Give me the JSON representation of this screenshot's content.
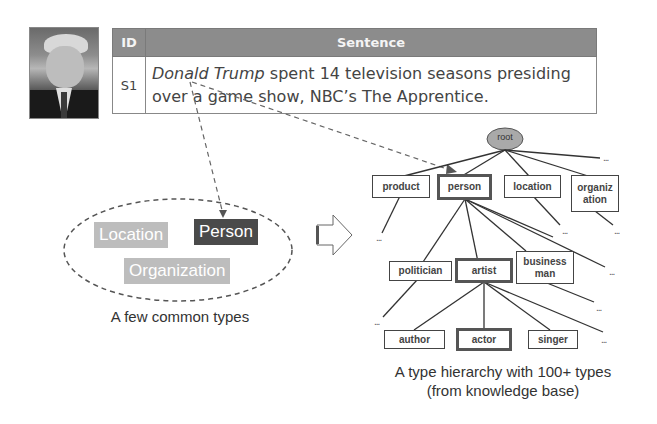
{
  "table": {
    "headers": [
      "ID",
      "Sentence"
    ],
    "rows": [
      {
        "id": "S1",
        "entity": "Donald Trump",
        "line1_rest": " spent 14 television seasons presiding",
        "line2": "over a game show, NBC’s The Apprentice."
      }
    ]
  },
  "left_panel": {
    "tags": [
      "Location",
      "Person",
      "Organization"
    ],
    "caption": "A few common types"
  },
  "hierarchy": {
    "root": "root",
    "level1": [
      "product",
      "person",
      "location",
      "organiz ation"
    ],
    "level2": [
      "politician",
      "artist",
      "business man"
    ],
    "level3": [
      "author",
      "actor",
      "singer"
    ],
    "ellipsis": "...",
    "caption_line1": "A type hierarchy with 100+ types",
    "caption_line2": "(from knowledge base)"
  },
  "colors": {
    "table_header": "#8c8c8c",
    "tag_light": "#bdbdbd",
    "tag_dark": "#4a4a4a",
    "root_fill": "#a9a9a9"
  }
}
